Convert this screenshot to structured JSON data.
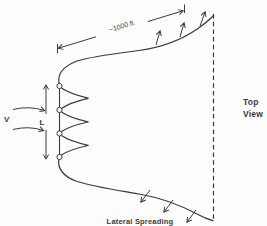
{
  "figure": {
    "dimension_label": "~1000 ft",
    "view_label": {
      "line1": "Top",
      "line2": "View"
    },
    "velocity_label": "V",
    "diffuser_length_label": "L",
    "spreading_label": "Lateral Spreading",
    "colors": {
      "ink": "#3a3a3a",
      "background": "#fdfdfd"
    },
    "elements": {
      "port_circles": 4,
      "merging_jets": 3
    }
  }
}
